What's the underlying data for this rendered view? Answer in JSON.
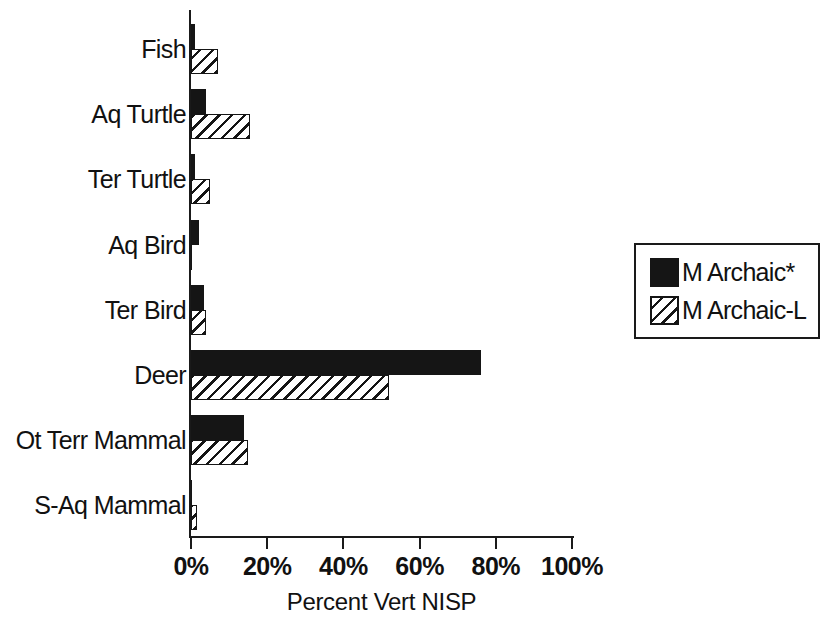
{
  "chart_data": {
    "type": "bar",
    "orientation": "horizontal",
    "title": "",
    "xlabel": "Percent Vert NISP",
    "ylabel": "",
    "xlim": [
      0,
      100
    ],
    "xticks": [
      "0%",
      "20%",
      "40%",
      "60%",
      "80%",
      "100%"
    ],
    "xtick_values": [
      0,
      20,
      40,
      60,
      80,
      100
    ],
    "grid": false,
    "legend_position": "right",
    "categories": [
      "Fish",
      "Aq Turtle",
      "Ter Turtle",
      "Aq Bird",
      "Ter Bird",
      "Deer",
      "Ot Terr Mammal",
      "S-Aq Mammal"
    ],
    "series": [
      {
        "name": "M Archaic*",
        "pattern": "solid",
        "color": "#151515",
        "values": [
          1,
          4,
          1,
          2,
          3.5,
          76,
          14,
          0
        ]
      },
      {
        "name": "M Archaic-L",
        "pattern": "hatched",
        "color": "#151515",
        "values": [
          7,
          15.5,
          5,
          0,
          4,
          52,
          15,
          1.5
        ]
      }
    ]
  },
  "axis": {
    "x_title": "Percent Vert NISP"
  },
  "legend": {
    "entries": [
      {
        "label": "M Archaic*",
        "swatch": "solid-black-swatch"
      },
      {
        "label": "M Archaic-L",
        "swatch": "hatched-swatch"
      }
    ]
  }
}
